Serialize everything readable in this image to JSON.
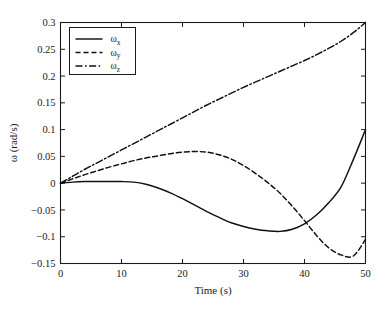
{
  "figure": {
    "background_color": "#ffffff",
    "line_color": "#111111",
    "axis_color": "#1a1a1a"
  },
  "chart_data": {
    "type": "line",
    "title": "",
    "subtitle": "",
    "xlabel": "Time (s)",
    "ylabel": "ω (rad/s)",
    "xlim": [
      0,
      50
    ],
    "ylim": [
      -0.15,
      0.3
    ],
    "xticks": [
      0,
      10,
      20,
      30,
      40,
      50
    ],
    "xticklabels": [
      "0",
      "10",
      "20",
      "30",
      "40",
      "50"
    ],
    "yticks": [
      -0.15,
      -0.1,
      -0.05,
      0,
      0.05,
      0.1,
      0.15,
      0.2,
      0.25,
      0.3
    ],
    "yticklabels": [
      "−0.15",
      "−0.1",
      "−0.05",
      "0",
      "0.05",
      "0.1",
      "0.15",
      "0.2",
      "0.25",
      "0.3"
    ],
    "grid": false,
    "legend_position": "upper left",
    "legend_entries": [
      {
        "label": "ω",
        "subscript": "x",
        "style": "solid",
        "dasharray": ""
      },
      {
        "label": "ω",
        "subscript": "y",
        "style": "dashed",
        "dasharray": "5,3"
      },
      {
        "label": "ω",
        "subscript": "z",
        "style": "dashdot",
        "dasharray": "7,2.5,1.6,2.5"
      }
    ],
    "x": [
      0,
      2,
      4,
      6,
      8,
      10,
      12,
      14,
      16,
      18,
      20,
      22,
      24,
      26,
      28,
      30,
      32,
      34,
      36,
      38,
      40,
      42,
      44,
      46,
      48,
      50
    ],
    "series": [
      {
        "name": "ωx",
        "style": "solid",
        "dasharray": "",
        "values": [
          0.0,
          0.002,
          0.003,
          0.003,
          0.003,
          0.003,
          0.002,
          -0.002,
          -0.009,
          -0.018,
          -0.029,
          -0.041,
          -0.053,
          -0.064,
          -0.074,
          -0.081,
          -0.086,
          -0.089,
          -0.09,
          -0.086,
          -0.076,
          -0.059,
          -0.036,
          -0.007,
          0.044,
          0.1
        ]
      },
      {
        "name": "ωy",
        "style": "dashed",
        "dasharray": "5,3",
        "values": [
          0.0,
          0.008,
          0.016,
          0.023,
          0.03,
          0.036,
          0.042,
          0.047,
          0.051,
          0.055,
          0.058,
          0.059,
          0.058,
          0.053,
          0.045,
          0.033,
          0.018,
          0.001,
          -0.019,
          -0.043,
          -0.07,
          -0.098,
          -0.121,
          -0.134,
          -0.136,
          -0.105
        ]
      },
      {
        "name": "ωz",
        "style": "dashdot",
        "dasharray": "7,2.5,1.6,2.5",
        "values": [
          0.0,
          0.013,
          0.026,
          0.038,
          0.05,
          0.062,
          0.074,
          0.086,
          0.098,
          0.11,
          0.122,
          0.134,
          0.146,
          0.157,
          0.168,
          0.179,
          0.189,
          0.199,
          0.209,
          0.219,
          0.229,
          0.24,
          0.252,
          0.265,
          0.281,
          0.3
        ]
      }
    ]
  }
}
